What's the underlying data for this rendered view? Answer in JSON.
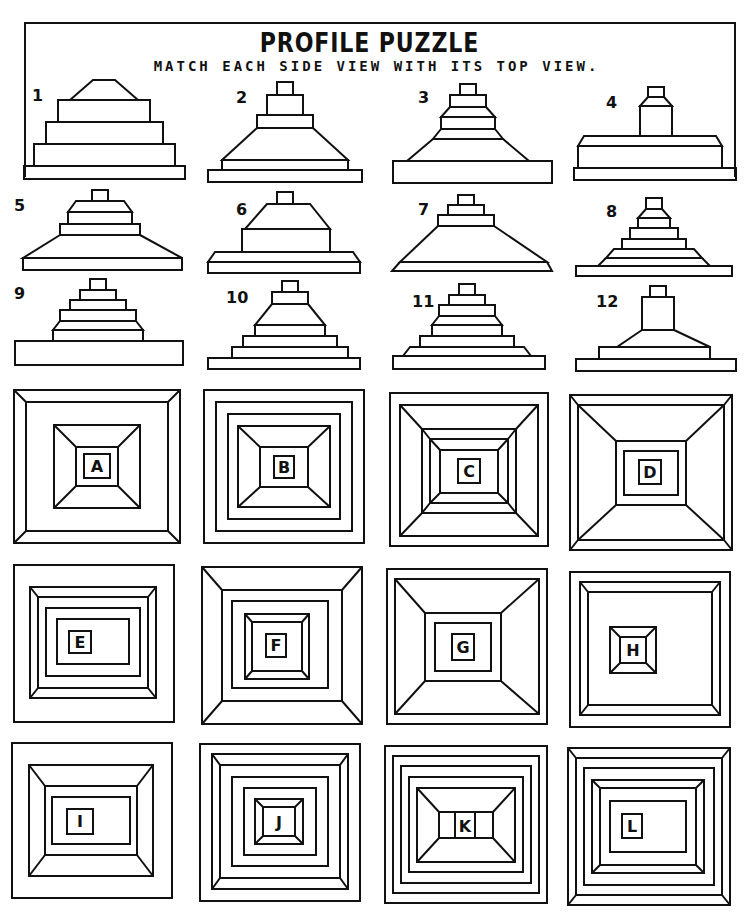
{
  "header": {
    "title": "PROFILE  PUZZLE",
    "subtitle": "MATCH EACH SIDE VIEW WITH ITS TOP VIEW."
  },
  "side_views": [
    {
      "label": "1"
    },
    {
      "label": "2"
    },
    {
      "label": "3"
    },
    {
      "label": "4"
    },
    {
      "label": "5"
    },
    {
      "label": "6"
    },
    {
      "label": "7"
    },
    {
      "label": "8"
    },
    {
      "label": "9"
    },
    {
      "label": "10"
    },
    {
      "label": "11"
    },
    {
      "label": "12"
    }
  ],
  "top_views": [
    {
      "label": "A"
    },
    {
      "label": "B"
    },
    {
      "label": "C"
    },
    {
      "label": "D"
    },
    {
      "label": "E"
    },
    {
      "label": "F"
    },
    {
      "label": "G"
    },
    {
      "label": "H"
    },
    {
      "label": "I"
    },
    {
      "label": "J"
    },
    {
      "label": "K"
    },
    {
      "label": "L"
    }
  ]
}
